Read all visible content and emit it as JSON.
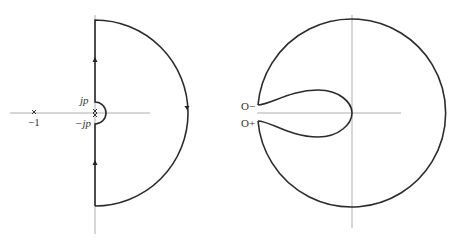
{
  "figure": {
    "left_panel": {
      "description": "Nyquist D-contour in s-plane indented around poles on imaginary axis",
      "labels": {
        "minus_one": "−1",
        "jp": "jp",
        "minus_jp": "−jp"
      },
      "markers": [
        "x at -1",
        "x at origin (pole pair)"
      ]
    },
    "right_panel": {
      "description": "Nyquist plot image of the contour",
      "labels": {
        "o_minus": "O−",
        "o_plus": "O+"
      }
    }
  }
}
